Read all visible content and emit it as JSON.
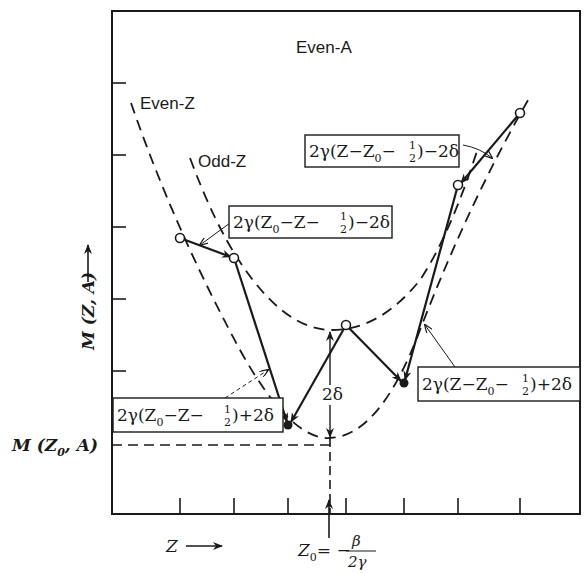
{
  "diagram": {
    "title_label": "Even-A",
    "curves": {
      "even_z_label": "Even-Z",
      "odd_z_label": "Odd-Z"
    },
    "y_axis": {
      "label": "M (Z, A)",
      "reference_label_main": "M (Z",
      "reference_label_sub": "0",
      "reference_label_tail": ", A)"
    },
    "x_axis": {
      "label": "Z",
      "z0_label_main": "Z",
      "z0_label_sub": "0",
      "z0_eq": "= −",
      "z0_num": "β",
      "z0_den": "2γ"
    },
    "gap_label": "2δ",
    "boxes": [
      {
        "id": "top-right",
        "prefix": "2γ(Z−Z",
        "sub": "0",
        "mid": "−",
        "frac_num": "1",
        "frac_den": "2",
        "suffix": ")−2δ"
      },
      {
        "id": "upper-left",
        "prefix": "2γ(Z",
        "sub": "0",
        "mid": "−Z−",
        "frac_num": "1",
        "frac_den": "2",
        "suffix": ")−2δ"
      },
      {
        "id": "lower-left",
        "prefix": "2γ(Z",
        "sub": "0",
        "mid": "−Z−",
        "frac_num": "1",
        "frac_den": "2",
        "suffix": ")+2δ"
      },
      {
        "id": "lower-right",
        "prefix": "2γ(Z−Z",
        "sub": "0",
        "mid": "−",
        "frac_num": "1",
        "frac_den": "2",
        "suffix": ")+2δ"
      }
    ],
    "points": {
      "odd_z_open": [
        [
          234,
          258
        ],
        [
          346,
          325
        ],
        [
          458,
          185
        ]
      ],
      "even_z_open": [
        [
          180,
          238
        ],
        [
          520,
          113
        ]
      ],
      "even_z_filled": [
        [
          288,
          425
        ],
        [
          404,
          383
        ]
      ]
    },
    "colors": {
      "ink": "#1a1a1a",
      "background": "#ffffff"
    }
  }
}
